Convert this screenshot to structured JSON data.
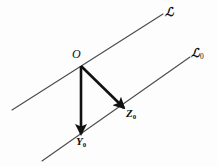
{
  "figure": {
    "background_color": "#fdfdfd",
    "line_color": "#4a4a4a",
    "vector_color": "#111111"
  },
  "labels": {
    "line_upper": "ℒ",
    "line_lower_base": "ℒ",
    "line_lower_sub": "0",
    "origin": "O",
    "vector_z_base": "Z",
    "vector_z_sub": "0",
    "vector_y_base": "Y",
    "vector_y_sub": "0"
  },
  "geometry": {
    "line_upper": {
      "x1": 12,
      "y1": 110,
      "x2": 163,
      "y2": 14
    },
    "line_lower": {
      "x1": 42,
      "y1": 161,
      "x2": 190,
      "y2": 57
    },
    "origin_point": {
      "x": 81,
      "y": 66
    },
    "vector_y_end": {
      "x": 81,
      "y": 134
    },
    "vector_z_end": {
      "x": 124,
      "y": 108
    }
  }
}
